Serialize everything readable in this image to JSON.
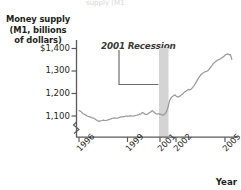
{
  "chart_data": {
    "type": "line",
    "title": "",
    "top_clipped_text": "supply (M1",
    "xlabel": "Year",
    "ylabel": "Money supply (M1, billions of dollars)",
    "ylabel_lines": [
      "Money supply",
      "(M1, billions",
      "of dollars)"
    ],
    "yticks": [
      "$1,400",
      "1,300",
      "1,200",
      "1,100"
    ],
    "ytick_values": [
      1400,
      1300,
      1200,
      1100
    ],
    "ylim": [
      1050,
      1420
    ],
    "y_axis_break": true,
    "xticks": [
      "1996",
      "1999",
      "2001",
      "2002",
      "2005"
    ],
    "xtick_values": [
      1996,
      1999,
      2001,
      2002,
      2005
    ],
    "xlim": [
      1995.7,
      2005.6
    ],
    "grid": false,
    "legend": false,
    "line_color": "#9a9a9a",
    "annotations": [
      {
        "text": "2001 Recession",
        "type": "leader-label",
        "points_to": "recession-band"
      }
    ],
    "shaded_regions": [
      {
        "name": "2001 Recession",
        "x_start": 2001.2,
        "x_end": 2001.9,
        "color": "#d4d4d4"
      }
    ],
    "series": [
      {
        "name": "Money supply (M1)",
        "x": [
          1996.0,
          1996.08,
          1996.17,
          1996.25,
          1996.33,
          1996.42,
          1996.5,
          1996.58,
          1996.67,
          1996.75,
          1996.83,
          1996.92,
          1997.0,
          1997.08,
          1997.17,
          1997.25,
          1997.33,
          1997.42,
          1997.5,
          1997.58,
          1997.67,
          1997.75,
          1997.83,
          1997.92,
          1998.0,
          1998.08,
          1998.17,
          1998.25,
          1998.33,
          1998.42,
          1998.5,
          1998.58,
          1998.67,
          1998.75,
          1998.83,
          1998.92,
          1999.0,
          1999.08,
          1999.17,
          1999.25,
          1999.33,
          1999.42,
          1999.5,
          1999.58,
          1999.67,
          1999.75,
          1999.83,
          1999.92,
          2000.0,
          2000.08,
          2000.17,
          2000.25,
          2000.33,
          2000.42,
          2000.5,
          2000.58,
          2000.67,
          2000.75,
          2000.83,
          2000.92,
          2001.0,
          2001.08,
          2001.17,
          2001.25,
          2001.33,
          2001.42,
          2001.5,
          2001.58,
          2001.67,
          2001.75,
          2001.83,
          2001.92,
          2002.0,
          2002.08,
          2002.17,
          2002.25,
          2002.33,
          2002.42,
          2002.5,
          2002.58,
          2002.67,
          2002.75,
          2002.83,
          2002.92,
          2003.0,
          2003.08,
          2003.17,
          2003.25,
          2003.33,
          2003.42,
          2003.5,
          2003.58,
          2003.67,
          2003.75,
          2003.83,
          2003.92,
          2004.0,
          2004.08,
          2004.17,
          2004.25,
          2004.33,
          2004.42,
          2004.5,
          2004.58,
          2004.67,
          2004.75,
          2004.83,
          2004.92,
          2005.0,
          2005.08,
          2005.17,
          2005.25,
          2005.33,
          2005.42
        ],
        "values": [
          1124,
          1122,
          1116,
          1110,
          1108,
          1104,
          1100,
          1098,
          1096,
          1094,
          1092,
          1090,
          1086,
          1082,
          1078,
          1076,
          1078,
          1080,
          1082,
          1081,
          1080,
          1082,
          1084,
          1086,
          1088,
          1090,
          1092,
          1091,
          1090,
          1092,
          1094,
          1096,
          1096,
          1097,
          1098,
          1100,
          1098,
          1100,
          1102,
          1100,
          1099,
          1101,
          1103,
          1104,
          1106,
          1108,
          1110,
          1116,
          1112,
          1108,
          1106,
          1110,
          1114,
          1118,
          1124,
          1120,
          1114,
          1110,
          1108,
          1110,
          1108,
          1106,
          1104,
          1106,
          1112,
          1124,
          1142,
          1168,
          1180,
          1186,
          1190,
          1194,
          1188,
          1184,
          1186,
          1190,
          1194,
          1200,
          1206,
          1210,
          1214,
          1218,
          1216,
          1220,
          1226,
          1234,
          1244,
          1254,
          1264,
          1274,
          1282,
          1288,
          1292,
          1296,
          1298,
          1300,
          1306,
          1314,
          1322,
          1330,
          1336,
          1342,
          1346,
          1350,
          1352,
          1356,
          1360,
          1364,
          1370,
          1374,
          1376,
          1372,
          1374,
          1352
        ]
      }
    ]
  }
}
